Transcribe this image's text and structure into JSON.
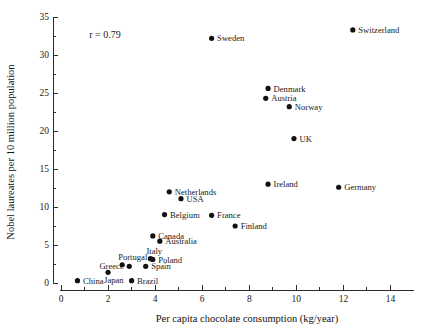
{
  "chart_data": {
    "type": "scatter",
    "title": "",
    "xlabel": "Per capita chocolate consumption (kg/year)",
    "ylabel": "Nobel laureates per 10 million population",
    "xlim": [
      0,
      15
    ],
    "ylim": [
      0,
      35
    ],
    "xticks": [
      0,
      2,
      4,
      6,
      8,
      10,
      12,
      14
    ],
    "xticklabels": [
      "0",
      "2",
      "4",
      "6",
      "8",
      "10",
      "12",
      "14"
    ],
    "xminorticks": [
      1,
      3,
      5,
      7,
      9,
      11,
      13
    ],
    "yticks": [
      0,
      5,
      10,
      15,
      20,
      25,
      30,
      35
    ],
    "yticklabels": [
      "0",
      "5",
      "10",
      "15",
      "20",
      "25",
      "30",
      "35"
    ],
    "yminorticks": [
      2.5,
      7.5,
      12.5,
      17.5,
      22.5,
      27.5,
      32.5
    ],
    "grid": false,
    "legend": "none",
    "annotations": [
      {
        "text": "r = 0.79",
        "x": 1.2,
        "y": 32.3
      }
    ],
    "marker_color": "#111111",
    "axis_color": "#2b2b2b",
    "points": [
      {
        "label": "Switzerland",
        "x": 12.4,
        "y": 33.3,
        "label_side": "right"
      },
      {
        "label": "Sweden",
        "x": 6.4,
        "y": 32.2,
        "label_side": "right"
      },
      {
        "label": "Denmark",
        "x": 8.8,
        "y": 25.6,
        "label_side": "right"
      },
      {
        "label": "Austria",
        "x": 8.7,
        "y": 24.3,
        "label_side": "right"
      },
      {
        "label": "Norway",
        "x": 9.7,
        "y": 23.2,
        "label_side": "right"
      },
      {
        "label": "UK",
        "x": 9.9,
        "y": 19.0,
        "label_side": "right"
      },
      {
        "label": "Ireland",
        "x": 8.8,
        "y": 13.0,
        "label_side": "right"
      },
      {
        "label": "Germany",
        "x": 11.8,
        "y": 12.6,
        "label_side": "right"
      },
      {
        "label": "Netherlands",
        "x": 4.6,
        "y": 12.0,
        "label_side": "right"
      },
      {
        "label": "USA",
        "x": 5.1,
        "y": 11.1,
        "label_side": "right"
      },
      {
        "label": "Belgium",
        "x": 4.4,
        "y": 9.0,
        "label_side": "right"
      },
      {
        "label": "France",
        "x": 6.4,
        "y": 8.9,
        "label_side": "right"
      },
      {
        "label": "Finland",
        "x": 7.4,
        "y": 7.5,
        "label_side": "right"
      },
      {
        "label": "Canada",
        "x": 3.9,
        "y": 6.2,
        "label_side": "right"
      },
      {
        "label": "Australia",
        "x": 4.2,
        "y": 5.5,
        "label_side": "right"
      },
      {
        "label": "Italy",
        "x": 3.8,
        "y": 3.2,
        "label_side": "above"
      },
      {
        "label": "Poland",
        "x": 3.9,
        "y": 3.1,
        "label_side": "right"
      },
      {
        "label": "Portugal",
        "x": 2.6,
        "y": 2.4,
        "label_side": "above"
      },
      {
        "label": "Greece",
        "x": 2.9,
        "y": 2.2,
        "label_side": "left"
      },
      {
        "label": "Spain",
        "x": 3.6,
        "y": 2.2,
        "label_side": "right"
      },
      {
        "label": "Japan",
        "x": 2.0,
        "y": 1.4,
        "label_side": "below"
      },
      {
        "label": "China",
        "x": 0.7,
        "y": 0.3,
        "label_side": "right"
      },
      {
        "label": "Brazil",
        "x": 3.0,
        "y": 0.3,
        "label_side": "right"
      }
    ]
  }
}
